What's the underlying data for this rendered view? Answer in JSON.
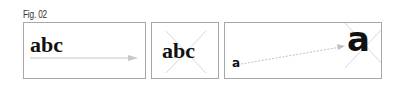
{
  "figure": {
    "label": "Fig. 02",
    "panels": [
      {
        "id": "panel-1",
        "text": "abc",
        "description": "serif text with horizontal arrow underneath pointing right"
      },
      {
        "id": "panel-2",
        "text": "abc",
        "description": "serif text with light X cross behind"
      },
      {
        "id": "panel-3",
        "small_text": "a",
        "large_text": "a",
        "description": "small 'a' with dotted arrow to large 'a' with X cross"
      }
    ],
    "colors": {
      "border": "#a8a8a8",
      "text": "#111111",
      "arrow": "#c8c8c8",
      "cross": "#d8d8d8"
    }
  }
}
